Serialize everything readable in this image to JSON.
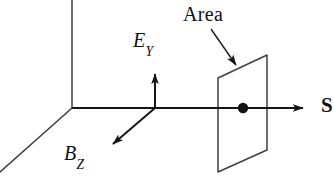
{
  "figure": {
    "background_color": "#ffffff",
    "stroke_color": "#1a1a1a",
    "labels": {
      "area": "Area",
      "e_field_symbol": "E",
      "e_field_subscript": "Y",
      "b_field_symbol": "B",
      "b_field_subscript": "Z",
      "s_axis": "S"
    },
    "elements": {
      "frame_origin": "72,108",
      "vertical_frame_axis": "72,0 to 72,108",
      "depth_frame_axis": "72,108 to 0,172",
      "horizontal_axis": "72,108 to 310,108",
      "e_arrow": "155,108 to 155,67",
      "b_arrow": "155,108 to 108,148",
      "s_arrow_tip": "310,108",
      "area_plane_corners": "218,78 267,55 267,150 218,172",
      "center_point": "243,108",
      "center_point_radius": "5",
      "area_leader_arrow": "212,30 to 240,70"
    }
  }
}
